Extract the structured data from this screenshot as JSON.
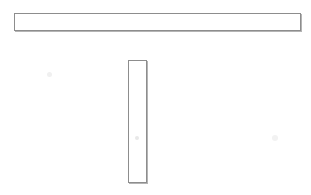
{
  "drawing": {
    "title": "T-shaped assembly line drawing",
    "description": "Two thin unfilled rectangles arranged in a T configuration: a long horizontal bar across the top and a shorter vertical bar centred below its left-of-centre region.",
    "medium": "scanned line art on white paper",
    "canvas": {
      "width": 311,
      "height": 195,
      "background_color": "#ffffff"
    },
    "stroke": {
      "color": "#8d8d8d",
      "shadow_color": "#b4b4b4",
      "width_px": 1
    },
    "shapes": [
      {
        "name": "horizontal-bar",
        "label": "Horizontal bar",
        "role": "top member of the T",
        "x": 14,
        "y": 13,
        "width": 287,
        "height": 18,
        "fill": "#ffffff",
        "stroke_color": "#8d8d8d"
      },
      {
        "name": "vertical-bar",
        "label": "Vertical bar",
        "role": "stem of the T",
        "x": 128,
        "y": 60,
        "width": 19,
        "height": 123,
        "fill": "#ffffff",
        "stroke_color": "#8d8d8d"
      }
    ],
    "artifacts": [
      {
        "name": "smudge-left",
        "x": 47,
        "y": 72,
        "size": 5,
        "color": "#f0f0f0"
      },
      {
        "name": "smudge-center",
        "x": 135,
        "y": 136,
        "size": 4,
        "color": "#e8e8e8"
      },
      {
        "name": "smudge-right",
        "x": 272,
        "y": 135,
        "size": 6,
        "color": "#f2f2f2"
      }
    ]
  }
}
